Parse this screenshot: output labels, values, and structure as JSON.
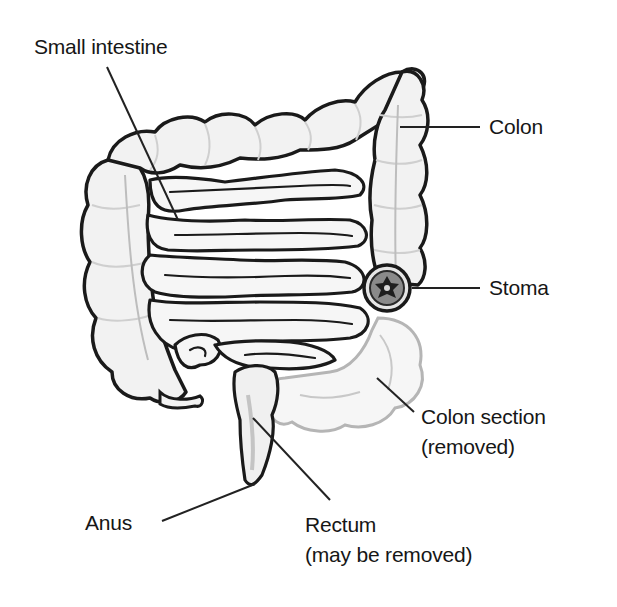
{
  "diagram": {
    "colors": {
      "outline": "#1a1a1a",
      "fill": "#f3f3f3",
      "removed_outline": "#b8b8b8",
      "stoma_fill": "#3a3a3a",
      "background": "#ffffff"
    },
    "labels": {
      "small_intestine": "Small intestine",
      "colon": "Colon",
      "stoma": "Stoma",
      "colon_section_line1": "Colon section",
      "colon_section_line2": "(removed)",
      "anus": "Anus",
      "rectum_line1": "Rectum",
      "rectum_line2": "(may be removed)"
    }
  }
}
